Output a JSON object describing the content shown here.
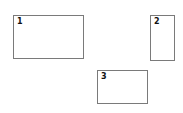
{
  "boxes": [
    {
      "label": "1",
      "x": 13,
      "y": 15,
      "w": 71,
      "h": 44
    },
    {
      "label": "2",
      "x": 150,
      "y": 15,
      "w": 25,
      "h": 46
    },
    {
      "label": "3",
      "x": 97,
      "y": 70,
      "w": 51,
      "h": 34
    }
  ]
}
